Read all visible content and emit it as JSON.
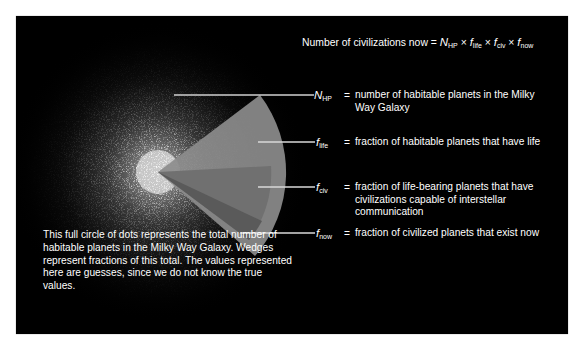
{
  "title_formula": {
    "lhs": "Number of civilizations now",
    "equals": "=",
    "terms": [
      {
        "symbol": "N",
        "sub": "HP"
      },
      {
        "symbol": "f",
        "sub": "life"
      },
      {
        "symbol": "f",
        "sub": "civ"
      },
      {
        "symbol": "f",
        "sub": "now"
      }
    ],
    "times": "×"
  },
  "labels": [
    {
      "symbol": "N",
      "sub": "HP",
      "equals": "=",
      "description": "number of habitable planets in the Milky Way Galaxy"
    },
    {
      "symbol": "f",
      "sub": "life",
      "equals": "=",
      "description": "fraction of habitable planets that have life"
    },
    {
      "symbol": "f",
      "sub": "civ",
      "equals": "=",
      "description": "fraction of life-bearing planets that have civilizations capable of interstellar communication"
    },
    {
      "symbol": "f",
      "sub": "now",
      "equals": "=",
      "description": "fraction of civilized planets that exist now"
    }
  ],
  "caption": "This full circle of dots represents the total number of habitable planets in the Milky Way Galaxy. Wedges represent fractions of this total. The values represented here are guesses, since we do not know the true values.",
  "colors": {
    "background": "#000000",
    "text": "#ffffff",
    "wedge_life": "#8a8a8a",
    "wedge_civ": "#6e6e6e",
    "wedge_now": "#575757",
    "leader_line": "#d8d8d8"
  }
}
